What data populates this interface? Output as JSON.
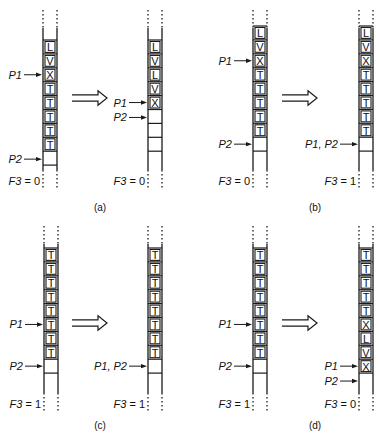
{
  "figure": {
    "panels": [
      {
        "id": "a",
        "caption": "(a)",
        "before": {
          "cells": [
            "L",
            "V",
            "X",
            "T",
            "T",
            "T",
            "T",
            "T"
          ],
          "empty_cells_below": 1,
          "pointers": [
            {
              "label": "P1",
              "target": "cell",
              "index": 2
            },
            {
              "label": "P2",
              "target": "boundary",
              "index": 8
            }
          ],
          "flag": {
            "name": "F3",
            "value": "0"
          }
        },
        "after": {
          "cells": [
            "L",
            "V",
            "L",
            "V",
            "X"
          ],
          "empty_cells_below": 3,
          "pointers": [
            {
              "label": "P1",
              "target": "cell",
              "index": 4
            },
            {
              "label": "P2",
              "target": "boundary",
              "index": 5
            }
          ],
          "flag": {
            "name": "F3",
            "value": "0"
          }
        }
      },
      {
        "id": "b",
        "caption": "(b)",
        "before": {
          "cells": [
            "L",
            "V",
            "X",
            "T",
            "T",
            "T",
            "T",
            "T"
          ],
          "empty_cells_below": 1,
          "pointers": [
            {
              "label": "P1",
              "target": "cell",
              "index": 2
            },
            {
              "label": "P2",
              "target": "cell",
              "index": 8
            }
          ],
          "flag": {
            "name": "F3",
            "value": "0"
          }
        },
        "after": {
          "cells": [
            "L",
            "V",
            "X",
            "T",
            "T",
            "T",
            "T",
            "T"
          ],
          "empty_cells_below": 1,
          "pointers": [
            {
              "label": "P1, P2",
              "target": "cell",
              "index": 8
            }
          ],
          "flag": {
            "name": "F3",
            "value": "1"
          }
        }
      },
      {
        "id": "c",
        "caption": "(c)",
        "before": {
          "cells": [
            "T",
            "T",
            "T",
            "T",
            "T",
            "T",
            "T",
            "T"
          ],
          "empty_cells_below": 1,
          "pointers": [
            {
              "label": "P1",
              "target": "cell",
              "index": 5
            },
            {
              "label": "P2",
              "target": "cell",
              "index": 8
            }
          ],
          "flag": {
            "name": "F3",
            "value": "1"
          }
        },
        "after": {
          "cells": [
            "T",
            "T",
            "T",
            "T",
            "T",
            "T",
            "T",
            "T"
          ],
          "empty_cells_below": 1,
          "pointers": [
            {
              "label": "P1, P2",
              "target": "cell",
              "index": 8
            }
          ],
          "flag": {
            "name": "F3",
            "value": "1"
          }
        }
      },
      {
        "id": "d",
        "caption": "(d)",
        "before": {
          "cells": [
            "T",
            "T",
            "T",
            "T",
            "T",
            "T",
            "T",
            "T"
          ],
          "empty_cells_below": 1,
          "pointers": [
            {
              "label": "P1",
              "target": "cell",
              "index": 5
            },
            {
              "label": "P2",
              "target": "cell",
              "index": 8
            }
          ],
          "flag": {
            "name": "F3",
            "value": "1"
          }
        },
        "after": {
          "cells": [
            "T",
            "T",
            "T",
            "T",
            "T",
            "X",
            "L",
            "V",
            "X"
          ],
          "empty_cells_below": 0,
          "pointers": [
            {
              "label": "P1",
              "target": "cell",
              "index": 8
            },
            {
              "label": "P2",
              "target": "boundary",
              "index": 9
            }
          ],
          "flag": {
            "name": "F3",
            "value": "0"
          }
        }
      }
    ],
    "transition_arrow": "double-right-arrow"
  }
}
